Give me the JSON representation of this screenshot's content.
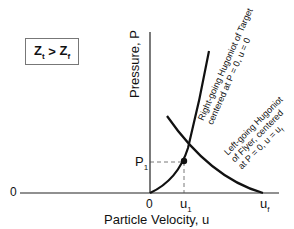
{
  "diagram": {
    "condition": {
      "left": "Z",
      "left_sub": "t",
      "op": ">",
      "right": "Z",
      "right_sub": "f"
    },
    "y_axis_label": "Pressure, P",
    "x_axis_label": "Particle Velocity, u",
    "y_zero_label": "0",
    "x_zero_label": "0",
    "p1_label": "P",
    "p1_sub": "1",
    "u1_label": "u",
    "u1_sub": "1",
    "uf_label": "u",
    "uf_sub": "f",
    "target_curve_line1": "Right-going Hugoniot of Target",
    "target_curve_line2": "centered at P = 0, u = 0",
    "flyer_curve_line1": "Left-going Hugoniot",
    "flyer_curve_line2": "of Flyer, centered",
    "flyer_curve_line3": "at P = 0, u = u",
    "flyer_curve_line3_sub": "f",
    "colors": {
      "line": "#111111",
      "box_border": "#777777",
      "dashed": "#555555"
    }
  }
}
